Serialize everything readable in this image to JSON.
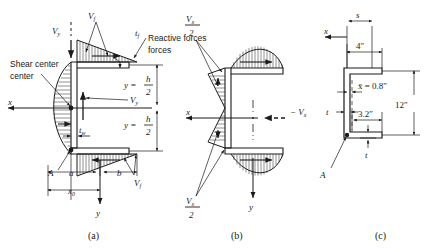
{
  "figure": {
    "panels": [
      {
        "id": "a",
        "caption": "(a)",
        "labels": {
          "shear_center": "Shear center",
          "reactive_forces": "Reactive forces",
          "Vy_top": "V",
          "Vy_top_sub": "y",
          "Vf_top": "V",
          "Vf_top_sub": "f",
          "tf": "t",
          "tf_sub": "f",
          "tw": "t",
          "tw_sub": "w",
          "Vy_mid": "V",
          "Vy_mid_sub": "y",
          "Vf_bot": "V",
          "Vf_bot_sub": "f",
          "point_A": "A",
          "dim_a": "a",
          "dim_b": "b",
          "dim_x0": "x",
          "dim_x0_sub": "0",
          "axis_x": "x",
          "axis_y": "y",
          "y_eq_1": "y =",
          "y_eq_2": "y =",
          "frac_num": "h",
          "frac_den": "2"
        }
      },
      {
        "id": "b",
        "caption": "(b)",
        "labels": {
          "Vx_half_top_num": "V",
          "Vx_half_top_num_sub": "x",
          "Vx_half_top_den": "2",
          "Vx_half_bot_num": "V",
          "Vx_half_bot_num_sub": "x",
          "Vx_half_bot_den": "2",
          "minus_Vx": "− V",
          "minus_Vx_sub": "x",
          "axis_x": "x",
          "axis_y": "y"
        }
      },
      {
        "id": "c",
        "caption": "(c)",
        "labels": {
          "s": "s",
          "axis_x": "x",
          "dim_4in": "4″",
          "xbar": "x̄ = 0.8″",
          "dim_3_2in": "3.2″",
          "dim_12in": "12″",
          "t_left": "t",
          "t_bottom": "t",
          "point_A": "A"
        }
      }
    ],
    "colors": {
      "ink": "#1a1a1a",
      "background": "#ffffff",
      "hatch": "#333333"
    }
  }
}
